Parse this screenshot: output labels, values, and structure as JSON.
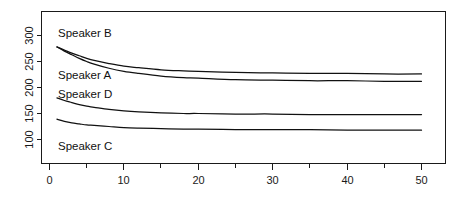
{
  "chart_data": {
    "type": "line",
    "title": "",
    "subtitle": "",
    "xlabel": "",
    "ylabel": "",
    "xlim": [
      0,
      52
    ],
    "ylim": [
      85,
      320
    ],
    "grid": false,
    "legend_position": "inline-annotations",
    "x_ticks": [
      0,
      10,
      20,
      30,
      40,
      50
    ],
    "x_tick_labels": [
      "0",
      "10",
      "20",
      "30",
      "40",
      "50"
    ],
    "x_minor_ticks": [
      5,
      15,
      25,
      35,
      45
    ],
    "y_ticks": [
      100,
      150,
      200,
      250,
      300
    ],
    "y_tick_labels": [
      "100",
      "150",
      "200",
      "250",
      "300"
    ],
    "x": [
      1,
      2,
      3,
      4,
      5,
      6,
      8,
      10,
      12,
      15,
      18,
      20,
      25,
      30,
      35,
      40,
      45,
      50
    ],
    "series": [
      {
        "name": "Speaker B",
        "label": "Speaker B",
        "color": "#111111",
        "values": [
          278,
          272,
          266,
          261,
          256,
          252,
          246,
          241,
          238,
          234,
          232,
          231,
          229,
          228,
          227,
          227,
          226,
          226
        ]
      },
      {
        "name": "Speaker A",
        "label": "Speaker A",
        "color": "#111111",
        "values": [
          278,
          270,
          263,
          256,
          250,
          245,
          237,
          231,
          227,
          222,
          219,
          218,
          215,
          214,
          213,
          213,
          212,
          212
        ]
      },
      {
        "name": "Speaker D",
        "label": "Speaker D",
        "color": "#111111",
        "values": [
          180,
          175,
          171,
          167,
          164,
          162,
          158,
          155,
          153,
          151,
          150,
          150,
          149,
          149,
          148,
          148,
          148,
          148
        ]
      },
      {
        "name": "Speaker C",
        "label": "Speaker C",
        "color": "#111111",
        "values": [
          139,
          135,
          132,
          130,
          128,
          127,
          125,
          123,
          122,
          121,
          120,
          120,
          119,
          119,
          119,
          118,
          118,
          118
        ]
      }
    ],
    "annotations": [
      {
        "text": "Speaker B",
        "x_value": 1.2,
        "y_value": 300
      },
      {
        "text": "Speaker A",
        "x_value": 1.2,
        "y_value": 231
      },
      {
        "text": "Speaker D",
        "x_value": 1.2,
        "y_value": 196
      },
      {
        "text": "Speaker C",
        "x_value": 1.2,
        "y_value": 103
      }
    ]
  },
  "labels": {
    "speaker_b": "Speaker B",
    "speaker_a": "Speaker A",
    "speaker_d": "Speaker D",
    "speaker_c": "Speaker C"
  },
  "y_axis": {
    "t100": "100",
    "t150": "150",
    "t200": "200",
    "t250": "250",
    "t300": "300"
  },
  "x_axis": {
    "t0": "0",
    "t10": "10",
    "t20": "20",
    "t30": "30",
    "t40": "40",
    "t50": "50"
  }
}
